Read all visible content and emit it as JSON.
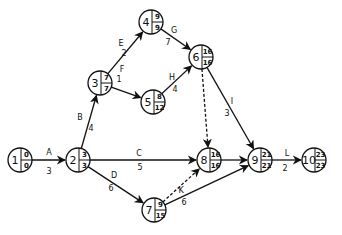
{
  "diagram": {
    "type": "activity-on-arrow network (CPM/PERT)",
    "nodes": [
      {
        "id": "1",
        "x": 20,
        "y": 160,
        "es": "0",
        "ls": "0"
      },
      {
        "id": "2",
        "x": 78,
        "y": 160,
        "es": "3",
        "ls": "3"
      },
      {
        "id": "3",
        "x": 100,
        "y": 83,
        "es": "7",
        "ls": "7"
      },
      {
        "id": "4",
        "x": 151,
        "y": 22,
        "es": "9",
        "ls": "9"
      },
      {
        "id": "5",
        "x": 153,
        "y": 102,
        "es": "8",
        "ls": "12"
      },
      {
        "id": "6",
        "x": 201,
        "y": 57,
        "es": "16",
        "ls": "16"
      },
      {
        "id": "7",
        "x": 154,
        "y": 210,
        "es": "9",
        "ls": "15"
      },
      {
        "id": "8",
        "x": 209,
        "y": 160,
        "es": "16",
        "ls": "16"
      },
      {
        "id": "9",
        "x": 260,
        "y": 160,
        "es": "21",
        "ls": "21"
      },
      {
        "id": "10",
        "x": 314,
        "y": 160,
        "es": "23",
        "ls": "23"
      }
    ],
    "edges": [
      {
        "from": "1",
        "to": "2",
        "activity": "A",
        "duration": "3",
        "dummy": false
      },
      {
        "from": "2",
        "to": "3",
        "activity": "B",
        "duration": "4",
        "dummy": false
      },
      {
        "from": "2",
        "to": "8",
        "activity": "C",
        "duration": "5",
        "dummy": false
      },
      {
        "from": "2",
        "to": "7",
        "activity": "D",
        "duration": "6",
        "dummy": false
      },
      {
        "from": "3",
        "to": "4",
        "activity": "E",
        "duration": "2",
        "dummy": false
      },
      {
        "from": "3",
        "to": "5",
        "activity": "F",
        "duration": "1",
        "dummy": false
      },
      {
        "from": "4",
        "to": "6",
        "activity": "G",
        "duration": "7",
        "dummy": false
      },
      {
        "from": "5",
        "to": "6",
        "activity": "H",
        "duration": "4",
        "dummy": false
      },
      {
        "from": "6",
        "to": "9",
        "activity": "I",
        "duration": "3",
        "dummy": false
      },
      {
        "from": "6",
        "to": "8",
        "activity": "",
        "duration": "",
        "dummy": true
      },
      {
        "from": "7",
        "to": "8",
        "activity": "",
        "duration": "",
        "dummy": true
      },
      {
        "from": "7",
        "to": "9",
        "activity": "K",
        "duration": "6",
        "dummy": false
      },
      {
        "from": "8",
        "to": "9",
        "activity": "",
        "duration": "",
        "dummy": false
      },
      {
        "from": "9",
        "to": "10",
        "activity": "L",
        "duration": "2",
        "dummy": false
      }
    ],
    "labels": [
      {
        "text": "A",
        "x": 49,
        "y": 155
      },
      {
        "text": "3",
        "x": 49,
        "y": 174
      },
      {
        "text": "B",
        "x": 80,
        "y": 120
      },
      {
        "text": "4",
        "x": 91,
        "y": 131
      },
      {
        "text": "E",
        "x": 121,
        "y": 46
      },
      {
        "text": "2",
        "x": 124,
        "y": 56
      },
      {
        "text": "F",
        "x": 122,
        "y": 72
      },
      {
        "text": "1",
        "x": 119,
        "y": 82
      },
      {
        "text": "G",
        "x": 174,
        "y": 33
      },
      {
        "text": "7",
        "x": 168,
        "y": 45
      },
      {
        "text": "H",
        "x": 172,
        "y": 80
      },
      {
        "text": "4",
        "x": 175,
        "y": 92
      },
      {
        "text": "I",
        "x": 232,
        "y": 104
      },
      {
        "text": "3",
        "x": 227,
        "y": 116
      },
      {
        "text": "C",
        "x": 139,
        "y": 156
      },
      {
        "text": "5",
        "x": 140,
        "y": 170
      },
      {
        "text": "D",
        "x": 114,
        "y": 178
      },
      {
        "text": "6",
        "x": 111,
        "y": 191
      },
      {
        "text": "K",
        "x": 181,
        "y": 193
      },
      {
        "text": "6",
        "x": 184,
        "y": 205
      },
      {
        "text": "L",
        "x": 287,
        "y": 156
      },
      {
        "text": "2",
        "x": 285,
        "y": 171
      }
    ]
  }
}
